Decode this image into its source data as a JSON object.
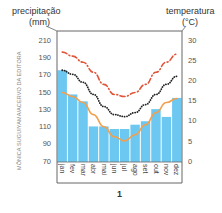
{
  "chart_data": {
    "type": "bar+line",
    "title": "",
    "figure_label": "1",
    "credit": "MÔNICA SUGUIYAMA/ACERVO DA EDITORA",
    "left_axis": {
      "label_line1": "precipitação",
      "label_line2": "(mm)",
      "ticks": [
        210,
        190,
        170,
        150,
        130,
        110,
        90,
        70
      ],
      "range": [
        70,
        220
      ]
    },
    "right_axis": {
      "label_line1": "temperatura",
      "label_line2": "(°C)",
      "ticks": [
        30,
        25,
        20,
        15,
        10,
        5,
        0
      ],
      "range": [
        0,
        32.5
      ]
    },
    "categories": [
      "jan",
      "fev",
      "mar",
      "abr",
      "mai",
      "jun",
      "jul",
      "ago",
      "set",
      "out",
      "nov",
      "dez"
    ],
    "series": [
      {
        "name": "precipitação",
        "type": "bar",
        "axis": "left",
        "color": "#6cc8f0",
        "values": [
          175,
          147,
          139,
          110,
          110,
          107,
          107,
          112,
          116,
          130,
          121,
          143
        ]
      },
      {
        "name": "temperatura máxima",
        "type": "line",
        "style": "dashed",
        "axis": "right",
        "color": "#e0553a",
        "values": [
          27,
          26,
          24.5,
          22,
          19,
          16.5,
          16,
          17,
          19,
          22,
          24.5,
          26.5
        ]
      },
      {
        "name": "temperatura média",
        "type": "line",
        "style": "dotted",
        "axis": "right",
        "color": "#222222",
        "values": [
          22.5,
          21.5,
          19.5,
          16.5,
          13.5,
          11.5,
          11,
          12,
          14,
          16.5,
          19,
          21
        ]
      },
      {
        "name": "temperatura mínima",
        "type": "line",
        "style": "solid",
        "axis": "right",
        "color": "#f0a050",
        "values": [
          17,
          16,
          14.5,
          11.5,
          8.5,
          6,
          5,
          6.5,
          9,
          12,
          14.5,
          15.5
        ]
      }
    ],
    "grid": false,
    "legend": "none"
  }
}
